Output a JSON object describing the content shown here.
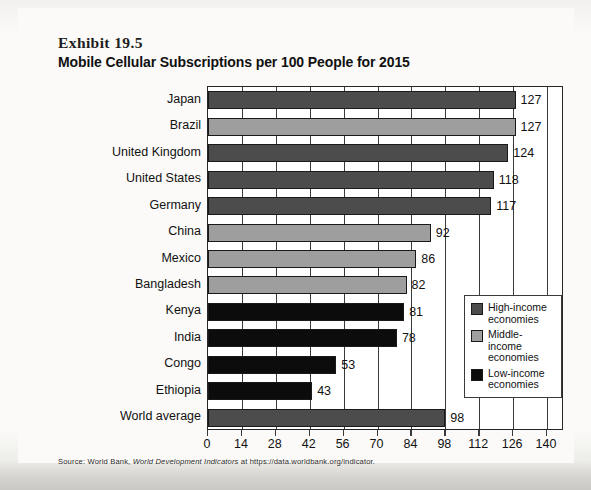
{
  "exhibit": {
    "label": "Exhibit 19.5",
    "title": "Mobile Cellular Subscriptions per 100 People for 2015"
  },
  "source": {
    "prefix": "Source: World Bank, ",
    "italic": "World Development Indicators",
    "suffix": " at https://data.worldbank.org/indicator."
  },
  "legend": {
    "position": "inside-right-lower",
    "items": [
      {
        "key": "high",
        "label": "High-income\neconomies",
        "line1": "High-income",
        "line2": "economies",
        "color": "#4c4c4c"
      },
      {
        "key": "middle",
        "label": "Middle-income\neconomies",
        "line1": "Middle-income",
        "line2": "economies",
        "color": "#9e9e9e"
      },
      {
        "key": "low",
        "label": "Low-income\neconomies",
        "line1": "Low-income",
        "line2": "economies",
        "color": "#0c0c0c"
      }
    ]
  },
  "chart_data": {
    "type": "bar",
    "orientation": "horizontal",
    "title": "Mobile Cellular Subscriptions per 100 People for 2015",
    "subtitle": "Exhibit 19.5",
    "xlabel": "",
    "ylabel": "",
    "xlim": [
      0,
      147
    ],
    "xticks": [
      0,
      14,
      28,
      42,
      56,
      70,
      84,
      98,
      112,
      126,
      140
    ],
    "xtick_labels": [
      "0",
      "14",
      "28",
      "42",
      "56",
      "70",
      "84",
      "98",
      "112",
      "126",
      "140"
    ],
    "grid": "vertical",
    "legend_position": "inside-right-lower",
    "categories": [
      "Japan",
      "Brazil",
      "United Kingdom",
      "United States",
      "Germany",
      "China",
      "Mexico",
      "Bangladesh",
      "Kenya",
      "India",
      "Congo",
      "Ethiopia",
      "World average"
    ],
    "values": [
      127,
      127,
      124,
      118,
      117,
      92,
      86,
      82,
      81,
      78,
      53,
      43,
      98
    ],
    "value_labels": [
      "127",
      "127",
      "124",
      "118",
      "117",
      "92",
      "86",
      "82",
      "81",
      "78",
      "53",
      "43",
      "98"
    ],
    "groups": [
      "high",
      "middle",
      "high",
      "high",
      "high",
      "middle",
      "middle",
      "middle",
      "low",
      "low",
      "low",
      "low",
      "high"
    ],
    "group_colors": {
      "high": "#4c4c4c",
      "middle": "#9e9e9e",
      "low": "#0c0c0c"
    },
    "series": [
      {
        "name": "Mobile cellular subscriptions per 100 people (2015)",
        "values": [
          127,
          127,
          124,
          118,
          117,
          92,
          86,
          82,
          81,
          78,
          53,
          43,
          98
        ]
      }
    ]
  }
}
